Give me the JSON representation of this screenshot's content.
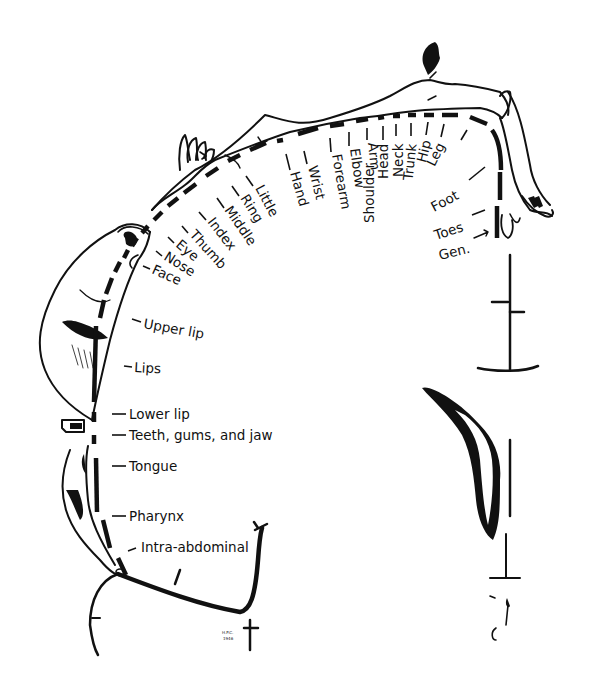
{
  "diagram": {
    "type": "sensory homunculus (cortical body map)",
    "colors": {
      "ink": "#111111",
      "background": "#ffffff"
    },
    "labels": {
      "little": "Little",
      "ring": "Ring",
      "middle": "Middle",
      "index": "Index",
      "thumb": "Thumb",
      "eye": "Eye",
      "nose": "Nose",
      "face": "Face",
      "upper_lip": "Upper lip",
      "lips": "Lips",
      "lower_lip": "Lower lip",
      "teeth": "Teeth, gums, and jaw",
      "tongue": "Tongue",
      "pharynx": "Pharynx",
      "intra_abdominal": "Intra-abdominal",
      "hand": "Hand",
      "wrist": "Wrist",
      "forearm": "Forearm",
      "elbow": "Elbow",
      "arm": "Arm",
      "shoulder": "Shoulder",
      "head": "Head",
      "neck": "Neck",
      "trunk": "Trunk",
      "hip": "Hip",
      "leg": "Leg",
      "foot": "Foot",
      "toes": "Toes",
      "genitals": "Gen."
    },
    "signature": {
      "line1": "H.P.C.",
      "line2": "1946"
    }
  }
}
